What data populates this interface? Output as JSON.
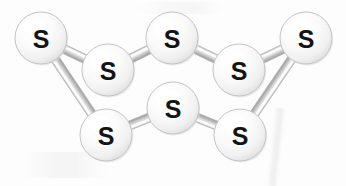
{
  "figure": {
    "background_color": "#fdfdfd",
    "width": 346,
    "height": 186
  },
  "style": {
    "atom_fill_light": "#ffffff",
    "atom_fill_mid": "#f4f4f4",
    "atom_fill_shadow": "#d9d9d9",
    "atom_edge_color": "#c4c4c4",
    "atom_label_color": "#141414",
    "bond_light": "#f2f2f2",
    "bond_mid": "#cfcfcf",
    "bond_dark": "#9a9a9a",
    "bond_edge": "#b0b0b0",
    "smudge_color": "#ededed",
    "atom_radius": 26,
    "bond_width": 9
  },
  "atoms": [
    {
      "id": "s1",
      "label": "S",
      "cx": 41,
      "cy": 38,
      "r": 26,
      "name": "sulfur-atom-1"
    },
    {
      "id": "s2",
      "label": "S",
      "cx": 108,
      "cy": 70,
      "r": 26,
      "name": "sulfur-atom-2"
    },
    {
      "id": "s3",
      "label": "S",
      "cx": 172,
      "cy": 38,
      "r": 26,
      "name": "sulfur-atom-3"
    },
    {
      "id": "s4",
      "label": "S",
      "cx": 239,
      "cy": 70,
      "r": 26,
      "name": "sulfur-atom-4"
    },
    {
      "id": "s5",
      "label": "S",
      "cx": 306,
      "cy": 38,
      "r": 26,
      "name": "sulfur-atom-5"
    },
    {
      "id": "s6",
      "label": "S",
      "cx": 240,
      "cy": 135,
      "r": 26,
      "name": "sulfur-atom-6"
    },
    {
      "id": "s7",
      "label": "S",
      "cx": 173,
      "cy": 108,
      "r": 26,
      "name": "sulfur-atom-7"
    },
    {
      "id": "s8",
      "label": "S",
      "cx": 106,
      "cy": 135,
      "r": 26,
      "name": "sulfur-atom-8"
    }
  ],
  "bonds": [
    {
      "id": "b1",
      "from": "s1",
      "to": "s2",
      "name": "bond-s1-s2"
    },
    {
      "id": "b2",
      "from": "s2",
      "to": "s3",
      "name": "bond-s2-s3"
    },
    {
      "id": "b3",
      "from": "s3",
      "to": "s4",
      "name": "bond-s3-s4"
    },
    {
      "id": "b4",
      "from": "s4",
      "to": "s5",
      "name": "bond-s4-s5"
    },
    {
      "id": "b5",
      "from": "s5",
      "to": "s6",
      "name": "bond-s5-s6"
    },
    {
      "id": "b6",
      "from": "s6",
      "to": "s7",
      "name": "bond-s6-s7"
    },
    {
      "id": "b7",
      "from": "s7",
      "to": "s8",
      "name": "bond-s7-s8"
    },
    {
      "id": "b8",
      "from": "s8",
      "to": "s1",
      "name": "bond-s8-s1"
    }
  ],
  "draw_order": [
    "b8",
    "b5",
    "b1",
    "b2",
    "b3",
    "b4",
    "b6",
    "b7",
    "s1",
    "s3",
    "s5",
    "s2",
    "s4",
    "s7",
    "s8",
    "s6"
  ],
  "smudges": [
    {
      "name": "paper-smudge-right",
      "x": 268,
      "y": 108,
      "w": 16,
      "h": 78,
      "rotate": 6,
      "opacity": 0.55
    },
    {
      "name": "paper-smudge-left",
      "x": 8,
      "y": 152,
      "w": 110,
      "h": 26,
      "rotate": 0,
      "opacity": 0.35
    },
    {
      "name": "paper-smudge-top",
      "x": 120,
      "y": 2,
      "w": 120,
      "h": 12,
      "rotate": 0,
      "opacity": 0.28
    }
  ]
}
